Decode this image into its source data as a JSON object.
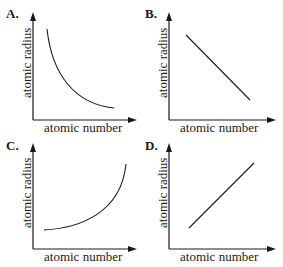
{
  "colors": {
    "ink": "#1a1a1a",
    "background": "#ffffff"
  },
  "panels": [
    {
      "label": "A.",
      "xlabel": "atomic number",
      "ylabel": "atomic radius",
      "trend": "decreasing-curve"
    },
    {
      "label": "B.",
      "xlabel": "atomic number",
      "ylabel": "atomic radius",
      "trend": "decreasing-linear"
    },
    {
      "label": "C.",
      "xlabel": "atomic number",
      "ylabel": "atomic radius",
      "trend": "increasing-curve"
    },
    {
      "label": "D.",
      "xlabel": "atomic number",
      "ylabel": "atomic radius",
      "trend": "increasing-linear"
    }
  ]
}
